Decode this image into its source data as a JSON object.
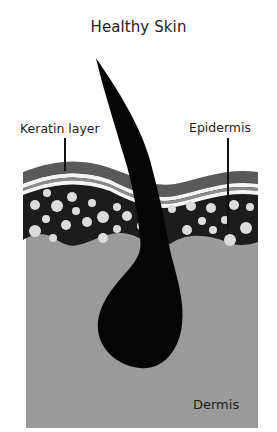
{
  "title": "Healthy Skin",
  "labels": {
    "keratin": "Keratin layer",
    "epidermis": "Epidermis",
    "dermis": "Dermis"
  },
  "colors": {
    "background": "#ffffff",
    "dermis": "#9a9a9a",
    "epidermis": "#1c1c1c",
    "keratin_outer": "#5a5a5a",
    "keratin_stripe": "#8a8a8a",
    "keratin_white": "#f4f4f4",
    "cells": "#dcdcdc",
    "hair": "#050505",
    "leader_lines": "#111111"
  },
  "layers": [
    "Keratin layer",
    "Epidermis",
    "Dermis"
  ]
}
